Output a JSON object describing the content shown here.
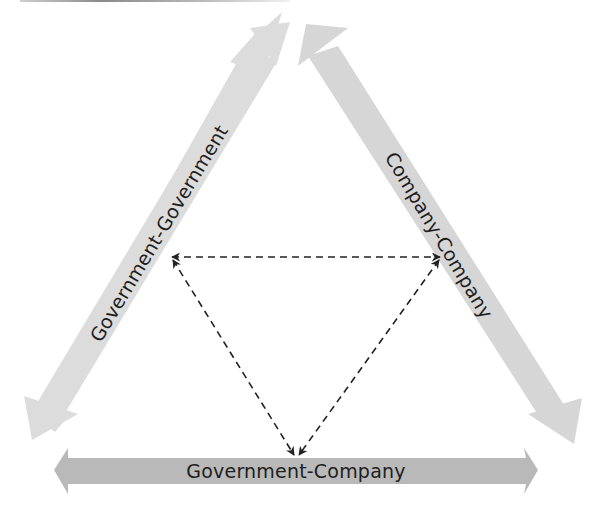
{
  "diagram": {
    "title": "",
    "colors": {
      "background": "#ffffff",
      "side_band": "#dcdcdc",
      "bottom_band": "#b9b9b9",
      "label_text": "#1e1e1e",
      "dashed_arrow": "#222222"
    },
    "bands": [
      {
        "id": "left",
        "label": "Government-Government",
        "orientation": "diagonal-up-right",
        "arrowheads": [
          "top",
          "bottom"
        ]
      },
      {
        "id": "right",
        "label": "Company-Company",
        "orientation": "diagonal-down-right",
        "arrowheads": [
          "top",
          "bottom"
        ]
      },
      {
        "id": "bottom",
        "label": "Government-Company",
        "orientation": "horizontal",
        "arrowheads": [
          "left",
          "right"
        ]
      }
    ],
    "dashed_links": [
      {
        "from": "left-band-midpoint",
        "to": "right-band-midpoint",
        "style": "dashed",
        "bidirectional": true
      },
      {
        "from": "left-band-midpoint",
        "to": "bottom-band-center",
        "style": "dashed",
        "bidirectional": true
      },
      {
        "from": "right-band-midpoint",
        "to": "bottom-band-center",
        "style": "dashed",
        "bidirectional": true
      }
    ]
  }
}
